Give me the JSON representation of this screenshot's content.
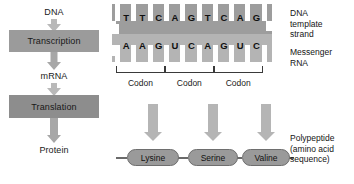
{
  "diagram": {
    "colors": {
      "process_box": "#9b9b9b",
      "process_box_dark": "#8d8d8d",
      "arrow": "#b9b9b9",
      "dna_strand": "#9d9d9d",
      "mrna_strand": "#b4b4b4",
      "amino_acid_pill": "#9a9a9a",
      "bracket": "#3a3a3a",
      "background": "#ffffff"
    }
  },
  "flowchart": {
    "start_label": "DNA",
    "step1_label": "Transcription",
    "middle_label": "mRNA",
    "step2_label": "Translation",
    "end_label": "Protein"
  },
  "strands": {
    "dna_template": {
      "name": "DNA template strand",
      "bases": [
        "T",
        "T",
        "C",
        "A",
        "G",
        "T",
        "C",
        "A",
        "G"
      ]
    },
    "messenger_rna": {
      "name": "Messenger RNA",
      "bases": [
        "A",
        "A",
        "G",
        "U",
        "C",
        "A",
        "G",
        "U",
        "C"
      ]
    }
  },
  "codons": [
    {
      "label": "Codon",
      "bases": "AAG",
      "amino_acid": "Lysine"
    },
    {
      "label": "Codon",
      "bases": "UCA",
      "amino_acid": "Serine"
    },
    {
      "label": "Codon",
      "bases": "GUC",
      "amino_acid": "Valine"
    }
  ],
  "annotations": {
    "dna_template_strand": "DNA\ntemplate\nstrand",
    "messenger_rna": "Messenger\nRNA",
    "polypeptide": "Polypeptide\n(amino acid\nsequence)"
  }
}
